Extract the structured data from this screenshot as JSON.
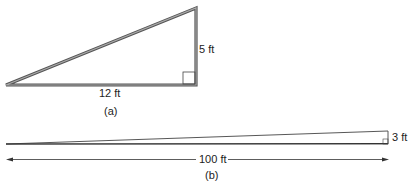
{
  "figure_a": {
    "height_label": "5 ft",
    "base_label": "12 ft",
    "caption": "(a)"
  },
  "figure_b": {
    "height_label": "3 ft",
    "length_label": "100 ft",
    "caption": "(b)"
  },
  "colors": {
    "stroke": "#444444",
    "fill": "#888888",
    "text": "#222222"
  }
}
